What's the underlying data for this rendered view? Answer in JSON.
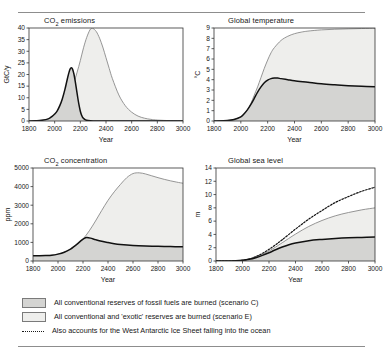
{
  "figure": {
    "background": "#ffffff",
    "colors": {
      "scenario_c_fill": "#d4d4d2",
      "scenario_e_fill": "#eeeeec",
      "scenario_c_line": "#111111",
      "scenario_e_line": "#8a8a8a",
      "dotted_line": "#111111",
      "axis": "#333333",
      "rule": "#8d8d8d"
    }
  },
  "legend": {
    "position": "bottom",
    "items": [
      {
        "swatch": "scenario-c",
        "label": "All conventional reserves of fossil fuels are burned (scenario C)"
      },
      {
        "swatch": "scenario-e",
        "label": "All conventional and 'exotic' reserves are burned (scenario E)"
      },
      {
        "swatch": "dotted-line",
        "label": "Also accounts for the West Antarctic Ice Sheet falling into the ocean"
      }
    ]
  },
  "chart_data": [
    {
      "id": "co2-emissions",
      "type": "area",
      "title": "CO2 emissions",
      "title_html": "CO₂ emissions",
      "xlabel": "Year",
      "ylabel": "GtC/y",
      "xlim": [
        1800,
        3000
      ],
      "ylim": [
        0,
        40
      ],
      "xticks": [
        1800,
        2000,
        2200,
        2400,
        2600,
        2800,
        3000
      ],
      "yticks": [
        0,
        5,
        10,
        15,
        20,
        25,
        30,
        35,
        40
      ],
      "grid": false,
      "legend_position": "external-bottom",
      "series": [
        {
          "name": "scenario E",
          "style": "area-grey-line",
          "x": [
            1800,
            1850,
            1900,
            1950,
            1980,
            2000,
            2020,
            2050,
            2080,
            2100,
            2125,
            2150,
            2175,
            2200,
            2225,
            2250,
            2275,
            2290,
            2300,
            2325,
            2350,
            2375,
            2400,
            2425,
            2450,
            2500,
            2550,
            2600,
            2650,
            2700,
            2750,
            2800,
            2900,
            3000
          ],
          "values": [
            0.0,
            0.1,
            0.3,
            0.8,
            1.8,
            2.6,
            3.6,
            5.6,
            8.0,
            10.0,
            13.0,
            16.5,
            21.0,
            26.0,
            31.5,
            36.0,
            39.2,
            39.9,
            39.8,
            38.4,
            35.6,
            31.8,
            27.2,
            22.6,
            18.2,
            11.2,
            6.6,
            3.8,
            2.1,
            1.2,
            0.7,
            0.4,
            0.15,
            0.05
          ]
        },
        {
          "name": "scenario C",
          "style": "area-black-line",
          "x": [
            1800,
            1850,
            1900,
            1950,
            1980,
            2000,
            2020,
            2040,
            2060,
            2080,
            2100,
            2110,
            2120,
            2130,
            2140,
            2150,
            2160,
            2170,
            2180,
            2190,
            2200,
            2210,
            2220,
            2240,
            2260,
            2300,
            2400,
            2600,
            3000
          ],
          "values": [
            0.0,
            0.1,
            0.3,
            0.9,
            2.0,
            3.0,
            4.4,
            6.6,
            9.6,
            13.6,
            18.4,
            20.6,
            22.3,
            22.9,
            22.2,
            20.2,
            17.2,
            13.6,
            10.0,
            6.8,
            4.2,
            2.5,
            1.4,
            0.5,
            0.2,
            0.05,
            0.0,
            0.0,
            0.0
          ]
        }
      ]
    },
    {
      "id": "global-temperature",
      "type": "area",
      "title": "Global temperature",
      "xlabel": "Year",
      "ylabel": "°C",
      "xlim": [
        1800,
        3000
      ],
      "ylim": [
        0,
        9
      ],
      "xticks": [
        1800,
        2000,
        2200,
        2400,
        2600,
        2800,
        3000
      ],
      "yticks": [
        0,
        1,
        2,
        3,
        4,
        5,
        6,
        7,
        8,
        9
      ],
      "grid": false,
      "legend_position": "external-bottom",
      "series": [
        {
          "name": "scenario E",
          "style": "area-grey-line",
          "x": [
            1800,
            1900,
            1950,
            2000,
            2025,
            2050,
            2075,
            2100,
            2125,
            2150,
            2175,
            2200,
            2225,
            2250,
            2300,
            2350,
            2400,
            2450,
            2500,
            2600,
            2700,
            2800,
            2900,
            3000
          ],
          "values": [
            0.0,
            0.05,
            0.15,
            0.4,
            0.7,
            1.1,
            1.7,
            2.5,
            3.3,
            4.2,
            5.1,
            5.9,
            6.6,
            7.1,
            7.8,
            8.2,
            8.45,
            8.6,
            8.7,
            8.82,
            8.88,
            8.92,
            8.95,
            8.98
          ]
        },
        {
          "name": "scenario C",
          "style": "area-black-line",
          "x": [
            1800,
            1900,
            1950,
            2000,
            2025,
            2050,
            2075,
            2100,
            2125,
            2150,
            2175,
            2200,
            2225,
            2250,
            2275,
            2300,
            2350,
            2400,
            2500,
            2600,
            2700,
            2800,
            2900,
            3000
          ],
          "values": [
            0.0,
            0.05,
            0.15,
            0.4,
            0.7,
            1.1,
            1.6,
            2.2,
            2.8,
            3.3,
            3.7,
            3.95,
            4.1,
            4.15,
            4.15,
            4.1,
            4.0,
            3.9,
            3.75,
            3.6,
            3.5,
            3.42,
            3.36,
            3.32
          ]
        }
      ]
    },
    {
      "id": "co2-concentration",
      "type": "area",
      "title": "CO2 concentration",
      "title_html": "CO₂ concentration",
      "xlabel": "Year",
      "ylabel": "ppm",
      "xlim": [
        1800,
        3000
      ],
      "ylim": [
        0,
        5000
      ],
      "xticks": [
        1800,
        2000,
        2200,
        2400,
        2600,
        2800,
        3000
      ],
      "yticks": [
        0,
        1000,
        2000,
        3000,
        4000,
        5000
      ],
      "grid": false,
      "legend_position": "external-bottom",
      "series": [
        {
          "name": "scenario E",
          "style": "area-grey-line",
          "x": [
            1800,
            1900,
            1950,
            2000,
            2050,
            2100,
            2150,
            2200,
            2250,
            2300,
            2350,
            2400,
            2450,
            2500,
            2550,
            2600,
            2650,
            2700,
            2750,
            2800,
            2850,
            2900,
            2950,
            3000
          ],
          "values": [
            280,
            295,
            310,
            370,
            470,
            620,
            850,
            1180,
            1620,
            2150,
            2720,
            3260,
            3720,
            4120,
            4480,
            4700,
            4740,
            4680,
            4580,
            4480,
            4390,
            4310,
            4240,
            4180
          ]
        },
        {
          "name": "scenario C",
          "style": "area-black-line",
          "x": [
            1800,
            1900,
            1950,
            2000,
            2050,
            2100,
            2130,
            2160,
            2190,
            2210,
            2230,
            2260,
            2300,
            2350,
            2400,
            2450,
            2500,
            2600,
            2700,
            2800,
            2900,
            3000
          ],
          "values": [
            280,
            295,
            310,
            370,
            470,
            640,
            790,
            950,
            1120,
            1220,
            1260,
            1230,
            1150,
            1060,
            990,
            930,
            890,
            840,
            810,
            790,
            775,
            760
          ]
        }
      ]
    },
    {
      "id": "global-sea-level",
      "type": "area",
      "title": "Global sea level",
      "xlabel": "Year",
      "ylabel": "m",
      "xlim": [
        1800,
        3000
      ],
      "ylim": [
        0,
        14
      ],
      "xticks": [
        1800,
        2000,
        2200,
        2400,
        2600,
        2800,
        3000
      ],
      "yticks": [
        0,
        2,
        4,
        6,
        8,
        10,
        12,
        14
      ],
      "grid": false,
      "legend_position": "external-bottom",
      "series": [
        {
          "name": "West Antarctic Ice Sheet collapse",
          "style": "dotted-line",
          "x": [
            1800,
            1900,
            1950,
            2000,
            2050,
            2100,
            2150,
            2200,
            2250,
            2300,
            2400,
            2500,
            2600,
            2700,
            2800,
            2900,
            3000
          ],
          "values": [
            0.0,
            0.0,
            0.02,
            0.1,
            0.3,
            0.65,
            1.15,
            1.75,
            2.45,
            3.2,
            4.8,
            6.3,
            7.6,
            8.8,
            9.7,
            10.5,
            11.1
          ]
        },
        {
          "name": "scenario E",
          "style": "area-grey-line",
          "x": [
            1800,
            1900,
            1950,
            2000,
            2050,
            2100,
            2150,
            2200,
            2250,
            2300,
            2400,
            2500,
            2600,
            2700,
            2800,
            2900,
            3000
          ],
          "values": [
            0.0,
            0.0,
            0.02,
            0.1,
            0.28,
            0.6,
            1.0,
            1.5,
            2.1,
            2.75,
            4.05,
            5.2,
            6.1,
            6.8,
            7.3,
            7.7,
            8.0
          ]
        },
        {
          "name": "scenario C",
          "style": "area-black-line",
          "x": [
            1800,
            1900,
            1950,
            2000,
            2050,
            2100,
            2150,
            2200,
            2250,
            2300,
            2350,
            2400,
            2500,
            2600,
            2700,
            2800,
            2900,
            3000
          ],
          "values": [
            0.0,
            0.0,
            0.02,
            0.1,
            0.25,
            0.5,
            0.85,
            1.25,
            1.7,
            2.1,
            2.45,
            2.7,
            3.05,
            3.25,
            3.4,
            3.5,
            3.55,
            3.6
          ]
        }
      ]
    }
  ]
}
